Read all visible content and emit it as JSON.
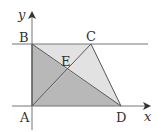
{
  "diagram": {
    "type": "geometry-coordinate-figure",
    "axes": {
      "x_label": "x",
      "y_label": "y"
    },
    "points": {
      "A": {
        "label": "A",
        "x": 32,
        "y": 106
      },
      "B": {
        "label": "B",
        "x": 32,
        "y": 44
      },
      "C": {
        "label": "C",
        "x": 91,
        "y": 44
      },
      "D": {
        "label": "D",
        "x": 121,
        "y": 106
      },
      "E": {
        "label": "E",
        "x": 68,
        "y": 70
      }
    },
    "regions": [
      {
        "name": "triangle-ABE",
        "vertices": [
          "A",
          "B",
          "E"
        ],
        "shade": "dark",
        "color": "#b8b8b8"
      },
      {
        "name": "triangle-AED",
        "vertices": [
          "A",
          "E",
          "D"
        ],
        "shade": "dark",
        "color": "#b8b8b8"
      },
      {
        "name": "triangle-BCE",
        "vertices": [
          "B",
          "C",
          "E"
        ],
        "shade": "light",
        "color": "#e2e2e2"
      },
      {
        "name": "triangle-CED",
        "vertices": [
          "C",
          "E",
          "D"
        ],
        "shade": "light",
        "color": "#e2e2e2"
      }
    ],
    "segments": [
      "AB",
      "BC",
      "CD",
      "DA",
      "AC",
      "BD"
    ],
    "extra_lines": [
      "horizontal line through B and C"
    ],
    "colors": {
      "line": "#555555",
      "dark_fill": "#b8b8b8",
      "light_fill": "#e2e2e2"
    }
  }
}
